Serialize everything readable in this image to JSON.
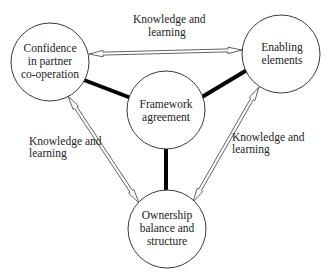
{
  "nodes": {
    "confidence": {
      "lines": [
        "Confidence",
        "in partner",
        "co-operation"
      ]
    },
    "enabling": {
      "lines": [
        "Enabling",
        "elements"
      ]
    },
    "framework": {
      "lines": [
        "Framework",
        "agreement"
      ]
    },
    "ownership": {
      "lines": [
        "Ownership",
        "balance and",
        "structure"
      ]
    }
  },
  "edge_labels": {
    "top": [
      "Knowledge and",
      "learning"
    ],
    "left": [
      "Knowledge and",
      "learning"
    ],
    "right": [
      "Knowledge and",
      "learning"
    ]
  },
  "links": {
    "thick": [
      {
        "from": "confidence",
        "to": "framework"
      },
      {
        "from": "enabling",
        "to": "framework"
      },
      {
        "from": "framework",
        "to": "ownership"
      }
    ],
    "double_arrows": [
      {
        "from": "confidence",
        "to": "enabling",
        "label": "top"
      },
      {
        "from": "confidence",
        "to": "ownership",
        "label": "left"
      },
      {
        "from": "enabling",
        "to": "ownership",
        "label": "right"
      }
    ]
  }
}
